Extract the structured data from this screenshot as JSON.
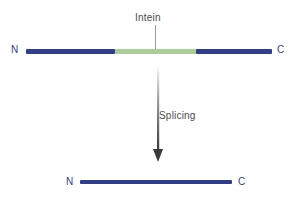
{
  "diagram": {
    "background_color": "#ffffff",
    "labels": {
      "intein": "Intein",
      "splicing": "Splicing",
      "n_terminus_top": "N",
      "c_terminus_top": "C",
      "n_terminus_bottom": "N",
      "c_terminus_bottom": "C"
    },
    "colors": {
      "extein_blue": "#2f3d8e",
      "intein_green": "#a9cd96",
      "leader_gray": "#9a9a9a",
      "arrow_dark": "#3a3a3a",
      "label_gray": "#4a4a4a"
    },
    "precursor": {
      "name": "precursor protein",
      "segments": [
        {
          "name": "N-extein",
          "color": "#2f3d8e",
          "width_px": 89
        },
        {
          "name": "intein",
          "color": "#a9cd96",
          "width_px": 81
        },
        {
          "name": "C-extein",
          "color": "#2f3d8e",
          "width_px": 76
        }
      ]
    },
    "mature": {
      "name": "spliced mature protein",
      "color": "#2f3d8e"
    },
    "arrow": {
      "name": "splicing-arrow",
      "direction": "down",
      "gradient_from": "#ffffff",
      "gradient_to": "#3a3a3a"
    }
  }
}
